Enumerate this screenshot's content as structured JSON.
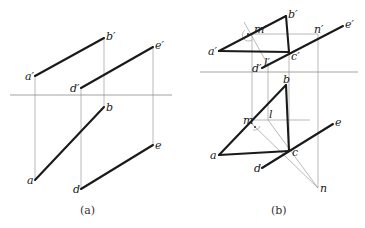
{
  "figure": {
    "panels": [
      {
        "caption": "(a)",
        "labels": {
          "a_prime": "a′",
          "b_prime": "b′",
          "d_prime": "d′",
          "e_prime": "e′",
          "a": "a",
          "b": "b",
          "d": "d",
          "e": "e"
        }
      },
      {
        "caption": "(b)",
        "labels": {
          "a_prime": "a′",
          "b_prime": "b′",
          "c_prime": "c′",
          "d_prime": "d′",
          "e_prime": "e′",
          "m_prime": "m′",
          "n_prime": "n′",
          "l_prime": "l′",
          "a": "a",
          "b": "b",
          "c": "c",
          "d": "d",
          "e": "e",
          "m": "m",
          "n": "n",
          "l": "l"
        }
      }
    ]
  }
}
